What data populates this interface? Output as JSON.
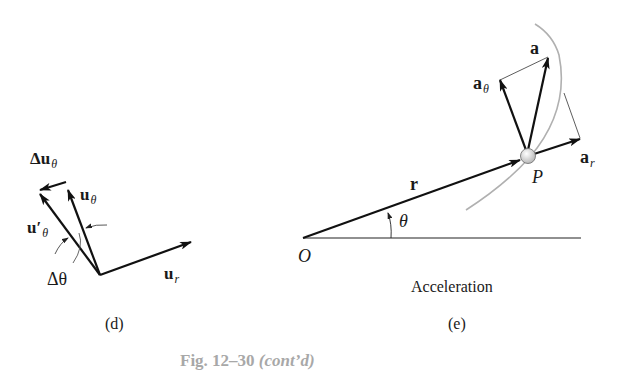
{
  "figure": {
    "caption_prefix": "Fig. 12–30",
    "caption_suffix": "(cont’d)",
    "caption_color": "#a8a8a8"
  },
  "panel_d": {
    "label": "(d)",
    "vectors": {
      "delta_u_theta": {
        "main": "Δu",
        "sub": "θ"
      },
      "u_theta": {
        "main": "u",
        "sub": "θ"
      },
      "u_theta_prime": {
        "main": "u′",
        "sub": "θ"
      },
      "u_r": {
        "main": "u",
        "sub": "r"
      }
    },
    "angle_label": "Δθ"
  },
  "panel_e": {
    "label": "(e)",
    "title": "Acceleration",
    "origin_label": "O",
    "point_label": "P",
    "angle_label": "θ",
    "vectors": {
      "r": {
        "main": "r"
      },
      "a": {
        "main": "a"
      },
      "a_theta": {
        "main": "a",
        "sub": "θ"
      },
      "a_r": {
        "main": "a",
        "sub": "r"
      }
    },
    "path_color": "#b0b0b0",
    "vector_color": "#111111"
  }
}
